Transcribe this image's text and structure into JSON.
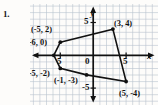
{
  "problem": {
    "number": "1."
  },
  "figure": {
    "type": "coordinate-grid-polygon",
    "axis_labels": {
      "x": "x",
      "y": "y"
    },
    "tick_labels": {
      "x_positive": "5",
      "x_negative": "5",
      "y_positive": "5",
      "y_negative": "-5",
      "origin": "0"
    },
    "grid": {
      "visible": true,
      "x_min": -9,
      "x_max": 9,
      "y_min": -7,
      "y_max": 7,
      "step": 1,
      "grid_color": "#b9c3cf",
      "axis_color": "#111111"
    },
    "polygon": {
      "stroke_color": "#111111",
      "fill": "none",
      "vertices": [
        {
          "label": "(-5, 2)",
          "x": -5,
          "y": 2
        },
        {
          "label": "(3, 4)",
          "x": 3,
          "y": 4
        },
        {
          "label": "(5, -4)",
          "x": 5,
          "y": -4
        },
        {
          "label": "(-1, -3)",
          "x": -1,
          "y": -3
        },
        {
          "label": "(-5, -2)",
          "x": -5,
          "y": -2
        },
        {
          "label": "(-6, 0)",
          "x": -6,
          "y": 0
        }
      ]
    },
    "vertex_label_text": {
      "v0": "(-5, 2)",
      "v1": "(3, 4)",
      "v2": "(5, -4)",
      "v3": "(-1, -3)",
      "v4": "(-5, -2)",
      "v5": "(-6, 0)"
    }
  }
}
